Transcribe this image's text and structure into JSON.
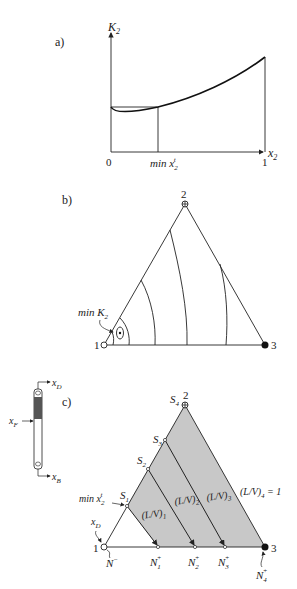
{
  "panel_a": {
    "label": "a)",
    "y_axis_label": "K",
    "y_axis_sub": "2",
    "x_axis_label": "x",
    "x_axis_sub": "2",
    "origin_label": "0",
    "x_end_label": "1",
    "min_label_prefix": "min x",
    "min_label_sub": "2",
    "min_label_sup": "t"
  },
  "panel_b": {
    "label": "b)",
    "vertex_top": "2",
    "vertex_left": "1",
    "vertex_right": "3",
    "min_label_prefix": "min K",
    "min_label_sub": "2"
  },
  "panel_c": {
    "label": "c)",
    "column": {
      "top_product": "x",
      "top_product_sub": "D",
      "feed": "x",
      "feed_sub": "F",
      "bottom_product": "x",
      "bottom_product_sub": "B"
    },
    "vertex_top": "2",
    "vertex_left": "1",
    "vertex_right": "3",
    "s_points": [
      {
        "label": "S",
        "sub": "1"
      },
      {
        "label": "S",
        "sub": "2"
      },
      {
        "label": "S",
        "sub": "3"
      },
      {
        "label": "S",
        "sub": "4"
      }
    ],
    "n_points": [
      {
        "label": "N",
        "sub": "1",
        "sup": "+"
      },
      {
        "label": "N",
        "sub": "2",
        "sup": "+"
      },
      {
        "label": "N",
        "sub": "3",
        "sup": "+"
      },
      {
        "label": "N",
        "sub": "4",
        "sup": "+"
      }
    ],
    "n_minus": {
      "label": "N",
      "sup": "−"
    },
    "xd_label": "x",
    "xd_sub": "D",
    "min_label_prefix": "min x",
    "min_label_sub": "2",
    "min_label_sup": "t",
    "lv_labels": [
      {
        "text": "(L/V)",
        "sub": "1"
      },
      {
        "text": "(L/V)",
        "sub": "2"
      },
      {
        "text": "(L/V)",
        "sub": "3"
      },
      {
        "text": "(L/V)",
        "sub": "4",
        "suffix": " = 1"
      }
    ],
    "shade_color": "#c8c8c8"
  }
}
